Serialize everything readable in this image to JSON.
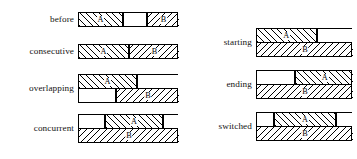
{
  "figure": {
    "interval_a_label": "A",
    "interval_b_label": "B",
    "hatch_a": "forward-diagonal",
    "hatch_b": "backward-diagonal",
    "line_color": "#000000",
    "background": "#ffffff"
  },
  "left_column": {
    "rows": [
      {
        "label": "before",
        "tracks": 1,
        "segments": [
          {
            "name": "A",
            "fill": "hatch-forward",
            "start": 0,
            "end": 44,
            "label": "A"
          },
          {
            "name": "gap",
            "fill": "blank",
            "start": 44,
            "end": 68,
            "label": ""
          },
          {
            "name": "B",
            "fill": "hatch-back",
            "start": 68,
            "end": 100,
            "label": "B"
          }
        ]
      },
      {
        "label": "consecutive",
        "tracks": 1,
        "segments": [
          {
            "name": "A",
            "fill": "hatch-forward",
            "start": 0,
            "end": 50,
            "label": "A"
          },
          {
            "name": "B",
            "fill": "hatch-back",
            "start": 50,
            "end": 100,
            "label": "B"
          }
        ]
      },
      {
        "label": "overlapping",
        "tracks": 2,
        "track_a": [
          {
            "name": "A",
            "fill": "hatch-forward",
            "start": 0,
            "end": 58,
            "label": "A"
          },
          {
            "name": "empty",
            "fill": "blank",
            "start": 58,
            "end": 100,
            "label": ""
          }
        ],
        "track_b": [
          {
            "name": "empty",
            "fill": "blank",
            "start": 0,
            "end": 37,
            "label": ""
          },
          {
            "name": "B",
            "fill": "hatch-back",
            "start": 37,
            "end": 100,
            "label": "B"
          }
        ]
      },
      {
        "label": "concurrent",
        "tracks": 2,
        "track_a": [
          {
            "name": "empty",
            "fill": "blank",
            "start": 0,
            "end": 26,
            "label": ""
          },
          {
            "name": "A",
            "fill": "hatch-forward",
            "start": 26,
            "end": 84,
            "label": "A"
          },
          {
            "name": "empty",
            "fill": "blank",
            "start": 84,
            "end": 100,
            "label": ""
          }
        ],
        "track_b": [
          {
            "name": "B",
            "fill": "hatch-back",
            "start": 0,
            "end": 100,
            "label": "B"
          }
        ]
      }
    ]
  },
  "right_column": {
    "rows": [
      {
        "label": "starting",
        "tracks": 2,
        "track_a": [
          {
            "name": "A",
            "fill": "hatch-forward",
            "start": 0,
            "end": 62,
            "label": "A"
          },
          {
            "name": "empty",
            "fill": "blank",
            "start": 62,
            "end": 100,
            "label": ""
          }
        ],
        "track_b": [
          {
            "name": "B",
            "fill": "hatch-back",
            "start": 0,
            "end": 100,
            "label": "B"
          }
        ]
      },
      {
        "label": "ending",
        "tracks": 2,
        "track_a": [
          {
            "name": "empty",
            "fill": "blank",
            "start": 0,
            "end": 40,
            "label": ""
          },
          {
            "name": "A",
            "fill": "hatch-forward",
            "start": 40,
            "end": 100,
            "label": "A"
          }
        ],
        "track_b": [
          {
            "name": "B",
            "fill": "hatch-back",
            "start": 0,
            "end": 100,
            "label": "B"
          }
        ]
      },
      {
        "label": "switched",
        "tracks": 2,
        "track_a": [
          {
            "name": "empty",
            "fill": "blank",
            "start": 0,
            "end": 18,
            "label": ""
          },
          {
            "name": "A",
            "fill": "hatch-forward",
            "start": 18,
            "end": 82,
            "label": "A"
          },
          {
            "name": "empty",
            "fill": "blank",
            "start": 82,
            "end": 100,
            "label": ""
          }
        ],
        "track_b": [
          {
            "name": "B",
            "fill": "hatch-back",
            "start": 0,
            "end": 100,
            "label": "B"
          }
        ]
      }
    ]
  },
  "geometry": {
    "left_bar_width": 100,
    "right_bar_width": 96,
    "row_tops_left": [
      12,
      44,
      74,
      114
    ],
    "row_tops_right": [
      28,
      70,
      112
    ]
  }
}
